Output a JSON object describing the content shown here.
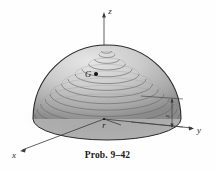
{
  "figure": {
    "title_caption": "Prob. 9–42",
    "shape_name": "hemisphere-dome",
    "axes": {
      "z_label": "z",
      "y_label": "y",
      "x_label": "x"
    },
    "annotations": {
      "centroid_label": "G",
      "radius_label": "r",
      "height_dimension_label": "z"
    },
    "colors": {
      "background": "#fefefe",
      "outline": "#2b2b2b",
      "dome_light": "#d8d8d8",
      "dome_mid": "#bdbdbd",
      "dome_dark": "#8e8e8e",
      "contour_line": "#6e6e6e",
      "shadow": "#cfcfcf",
      "axis_line": "#3a3a3a",
      "text": "#1a1a1a"
    },
    "contour_ring_count": 14
  }
}
